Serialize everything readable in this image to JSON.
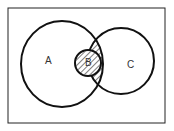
{
  "diagram": {
    "type": "venn",
    "sets": [
      {
        "id": "A",
        "label": "A"
      },
      {
        "id": "B",
        "label": "B"
      },
      {
        "id": "C",
        "label": "C"
      }
    ],
    "shaded_region": "A ∩ C",
    "relations": [
      "B ⊂ A ∩ C"
    ],
    "colors": {
      "stroke": "#111111",
      "background": "#ffffff"
    }
  }
}
